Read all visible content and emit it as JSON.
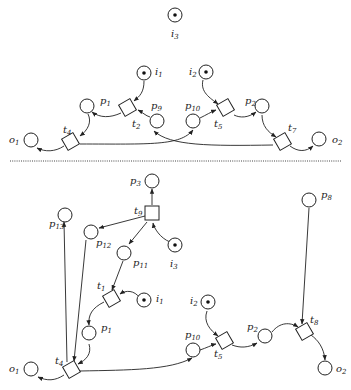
{
  "diagram": {
    "type": "petri-net",
    "separator": "dotted-horizontal",
    "top": {
      "places": [
        {
          "id": "i3_top",
          "name": "i",
          "sub": "3",
          "token": true
        },
        {
          "id": "i1_top",
          "name": "i",
          "sub": "1",
          "token": true
        },
        {
          "id": "i2_top",
          "name": "i",
          "sub": "2",
          "token": true
        },
        {
          "id": "p1_top",
          "name": "p",
          "sub": "1",
          "token": false
        },
        {
          "id": "p9_top",
          "name": "p",
          "sub": "9",
          "token": false
        },
        {
          "id": "p10_top",
          "name": "p",
          "sub": "10",
          "token": false
        },
        {
          "id": "p2_top",
          "name": "p",
          "sub": "2",
          "token": false
        },
        {
          "id": "o1_top",
          "name": "o",
          "sub": "1",
          "token": false
        },
        {
          "id": "o2_top",
          "name": "o",
          "sub": "2",
          "token": false
        }
      ],
      "transitions": [
        {
          "id": "t2_top",
          "name": "t",
          "sub": "2"
        },
        {
          "id": "t5_top",
          "name": "t",
          "sub": "5"
        },
        {
          "id": "t4_top",
          "name": "t",
          "sub": "4"
        },
        {
          "id": "t7_top",
          "name": "t",
          "sub": "7"
        }
      ],
      "arcs": [
        [
          "i1",
          "t2"
        ],
        [
          "p9",
          "t2"
        ],
        [
          "t2",
          "p1"
        ],
        [
          "p1",
          "t4"
        ],
        [
          "t4",
          "o1"
        ],
        [
          "t4",
          "p10"
        ],
        [
          "i2",
          "t5"
        ],
        [
          "p10",
          "t5"
        ],
        [
          "t5",
          "p2"
        ],
        [
          "p2",
          "t7"
        ],
        [
          "t7",
          "o2"
        ],
        [
          "t7",
          "p9"
        ]
      ]
    },
    "bottom": {
      "places": [
        {
          "id": "p3_bot",
          "name": "p",
          "sub": "3",
          "token": false
        },
        {
          "id": "p13_bot",
          "name": "p",
          "sub": "13",
          "token": false
        },
        {
          "id": "p12_bot",
          "name": "p",
          "sub": "12",
          "token": false
        },
        {
          "id": "p11_bot",
          "name": "p",
          "sub": "11",
          "token": false
        },
        {
          "id": "i3_bot",
          "name": "i",
          "sub": "3",
          "token": true
        },
        {
          "id": "i1_bot",
          "name": "i",
          "sub": "1",
          "token": true
        },
        {
          "id": "p1_bot",
          "name": "p",
          "sub": "1",
          "token": false
        },
        {
          "id": "o1_bot",
          "name": "o",
          "sub": "1",
          "token": false
        },
        {
          "id": "i2_bot",
          "name": "i",
          "sub": "2",
          "token": true
        },
        {
          "id": "p10_bot",
          "name": "p",
          "sub": "10",
          "token": false
        },
        {
          "id": "p2_bot",
          "name": "p",
          "sub": "2",
          "token": false
        },
        {
          "id": "p8_bot",
          "name": "p",
          "sub": "8",
          "token": false
        },
        {
          "id": "o2_bot",
          "name": "o",
          "sub": "2",
          "token": false
        }
      ],
      "transitions": [
        {
          "id": "t9_bot",
          "name": "t",
          "sub": "9"
        },
        {
          "id": "t1_bot",
          "name": "t",
          "sub": "1"
        },
        {
          "id": "t4_bot",
          "name": "t",
          "sub": "4"
        },
        {
          "id": "t5_bot",
          "name": "t",
          "sub": "5"
        },
        {
          "id": "t8_bot",
          "name": "t",
          "sub": "8"
        }
      ],
      "arcs": [
        [
          "t9",
          "p3"
        ],
        [
          "i3",
          "t9"
        ],
        [
          "t9",
          "p12"
        ],
        [
          "t9",
          "p11"
        ],
        [
          "p11",
          "t1"
        ],
        [
          "i1",
          "t1"
        ],
        [
          "t1",
          "p1"
        ],
        [
          "p1",
          "t4"
        ],
        [
          "p12",
          "t4"
        ],
        [
          "t4",
          "p13"
        ],
        [
          "t4",
          "o1"
        ],
        [
          "t4",
          "p10"
        ],
        [
          "p10",
          "t5"
        ],
        [
          "i2",
          "t5"
        ],
        [
          "t5",
          "p2"
        ],
        [
          "p2",
          "t8"
        ],
        [
          "p8",
          "t8"
        ],
        [
          "t8",
          "o2"
        ]
      ]
    }
  }
}
